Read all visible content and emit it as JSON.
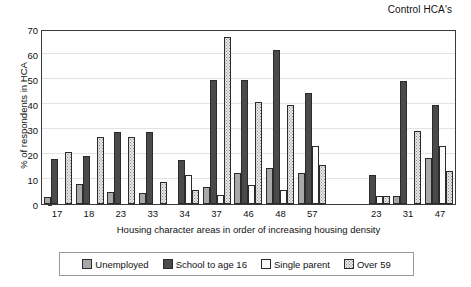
{
  "chart_data": {
    "type": "bar",
    "title": "Control HCA's",
    "xlabel": "Housing character areas in order of increasing housing density",
    "ylabel": "% of respondents in HCA",
    "ylim": [
      0,
      70
    ],
    "yticks": [
      0,
      10,
      20,
      30,
      40,
      50,
      60,
      70
    ],
    "grid": true,
    "legend_position": "bottom",
    "categories": [
      "17",
      "18",
      "23",
      "33",
      "34",
      "37",
      "46",
      "48",
      "57",
      "",
      "23",
      "31",
      "47"
    ],
    "series": [
      {
        "name": "Unemployed",
        "color": "#a8a8a8",
        "pattern": "solid-light",
        "values": [
          3.0,
          8.0,
          4.8,
          4.6,
          0,
          6.7,
          12.5,
          14.5,
          12.4,
          null,
          0,
          3.4,
          18.4
        ]
      },
      {
        "name": "School to age 16",
        "color": "#4a4a4a",
        "pattern": "solid-dark",
        "values": [
          18.0,
          19.1,
          28.8,
          28.8,
          17.8,
          49.6,
          49.6,
          61.6,
          44.4,
          null,
          11.5,
          49.3,
          39.5
        ]
      },
      {
        "name": "Single parent",
        "color": "#fbfbfb",
        "pattern": "solid-white",
        "values": [
          0,
          0,
          0,
          0,
          11.8,
          3.6,
          7.5,
          5.6,
          23.4,
          null,
          3.3,
          0,
          23.2
        ]
      },
      {
        "name": "Over 59",
        "color": "#e8e8e8",
        "pattern": "dotted",
        "values": [
          21.0,
          26.9,
          26.8,
          8.9,
          5.8,
          66.7,
          40.7,
          39.7,
          15.5,
          null,
          3.4,
          29.4,
          13.2
        ]
      }
    ],
    "legend_entries": [
      "Unemployed",
      "School to age 16",
      "Single parent",
      "Over 59"
    ]
  }
}
